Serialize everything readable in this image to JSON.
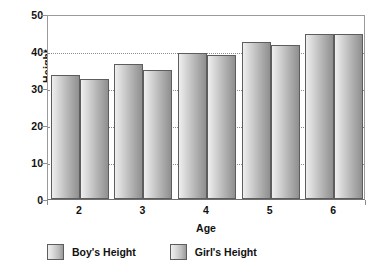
{
  "chart_data": {
    "type": "bar",
    "title": "",
    "xlabel": "Age",
    "ylabel": "Height",
    "categories": [
      "2",
      "3",
      "4",
      "5",
      "6"
    ],
    "series": [
      {
        "name": "Boy's Height",
        "values": [
          33.5,
          36.5,
          39.5,
          42.5,
          44.5
        ]
      },
      {
        "name": "Girl's Height",
        "values": [
          32.5,
          35.0,
          39.0,
          41.5,
          44.5
        ]
      }
    ],
    "ylim": [
      0,
      50
    ],
    "yticks": [
      "0",
      "10",
      "20",
      "30",
      "40",
      "50"
    ],
    "ytick_values": [
      0,
      10,
      20,
      30,
      40,
      50
    ],
    "grid": true,
    "grid_axis": "y",
    "legend_position": "bottom-left",
    "colors": {
      "bar_light": "#efefef",
      "bar_dark": "#8f8f8f",
      "bar_border": "#5d5d5d",
      "gridline": "#8d8d8d",
      "axis": "#9a9a9a",
      "text": "#111111",
      "background": "#ffffff"
    }
  },
  "legend": {
    "items": [
      {
        "label": "Boy's Height"
      },
      {
        "label": "Girl's Height"
      }
    ]
  }
}
